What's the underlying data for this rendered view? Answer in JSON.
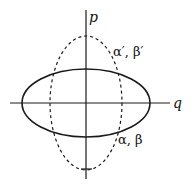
{
  "diagram": {
    "axes": {
      "vertical_label": "p",
      "horizontal_label": "q"
    },
    "curves": [
      {
        "id": "solid-ellipse",
        "style": "solid",
        "label": "α, β",
        "cx": 86,
        "cy": 103,
        "rx": 64,
        "ry": 34
      },
      {
        "id": "dashed-ellipse",
        "style": "dashed",
        "label": "α′, β′",
        "cx": 86,
        "cy": 103,
        "rx": 36,
        "ry": 67
      }
    ],
    "colors": {
      "stroke": "#1a1a1a",
      "background": "#ffffff"
    }
  }
}
